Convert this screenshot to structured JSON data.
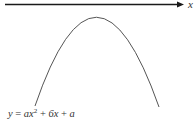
{
  "axis": {
    "label": "x",
    "color": "#1a1a1a"
  },
  "curve": {
    "type": "downward-parabola",
    "color": "#555555"
  },
  "equation": {
    "lhs": "y",
    "eq": " = ",
    "term1_coef": "ax",
    "term1_exp": "2",
    "plus1": " + ",
    "term2": "6x",
    "plus2": " + ",
    "term3": "a"
  }
}
